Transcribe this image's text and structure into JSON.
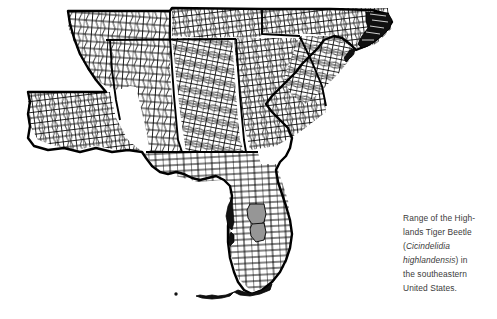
{
  "figure": {
    "type": "distribution-range-map",
    "background_color": "#ffffff",
    "outline_color": "#000000",
    "county_line_color": "#000000",
    "range_fill_color": "#969696"
  },
  "map": {
    "title": "",
    "region_label": "Southeastern United States",
    "states_shown": [
      "Arkansas",
      "Louisiana",
      "Mississippi",
      "Tennessee",
      "Alabama",
      "Georgia",
      "Florida",
      "South Carolina",
      "North Carolina"
    ],
    "highlighted_counties": [
      "Polk County, Florida",
      "Highlands County, Florida"
    ],
    "highlight_fill": "#969696",
    "highlight_description": "Two adjacent shaded counties in the central Florida peninsula"
  },
  "caption": {
    "line1": "Range of the High-",
    "line2": "lands Tiger Beetle",
    "line3_open": "(",
    "line3_sci": "Cicindelidia",
    "line4_sci": "highlandensis",
    "line4_tail": ") in",
    "line5": "the southeastern",
    "line6": "United States.",
    "full_text": "Range of the Highlands Tiger Beetle (Cicindelidia highlandensis) in the southeastern United States.",
    "text_color": "#3b3b3b"
  }
}
